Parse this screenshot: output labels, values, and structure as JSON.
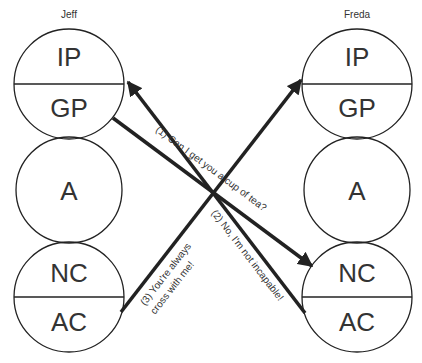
{
  "diagram": {
    "type": "transactional-analysis-crossed-transactions",
    "people": [
      {
        "name": "Jeff",
        "states": [
          {
            "label": "IP",
            "group": "parent"
          },
          {
            "label": "GP",
            "group": "parent"
          },
          {
            "label": "A",
            "group": "adult"
          },
          {
            "label": "NC",
            "group": "child"
          },
          {
            "label": "AC",
            "group": "child"
          }
        ]
      },
      {
        "name": "Freda",
        "states": [
          {
            "label": "IP",
            "group": "parent"
          },
          {
            "label": "GP",
            "group": "parent"
          },
          {
            "label": "A",
            "group": "adult"
          },
          {
            "label": "NC",
            "group": "child"
          },
          {
            "label": "AC",
            "group": "child"
          }
        ]
      }
    ],
    "transactions": [
      {
        "id": 1,
        "from": "Jeff.GP",
        "to": "Freda.NC",
        "label": "(1) Can I get you a cup of tea?"
      },
      {
        "id": 2,
        "from": "Freda.AC",
        "to": "Jeff.IP",
        "label": "(2) No, I'm not incapable!"
      },
      {
        "id": 3,
        "from": "Jeff.AC",
        "to": "Freda.IP",
        "label_line1": "(3) You're always",
        "label_line2": "cross with me!"
      }
    ],
    "colors": {
      "stroke": "#222222",
      "text": "#333333",
      "background": "#ffffff"
    }
  }
}
